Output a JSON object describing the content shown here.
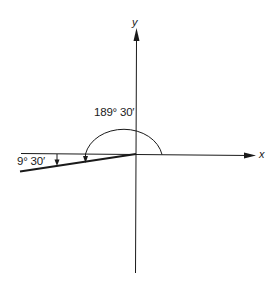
{
  "diagram": {
    "axes": {
      "x_label": "x",
      "y_label": "y"
    },
    "angles": {
      "large_angle_label": "189° 30′",
      "small_angle_label": "9° 30′"
    },
    "colors": {
      "stroke": "#1a1a1a",
      "background": "#ffffff"
    }
  }
}
